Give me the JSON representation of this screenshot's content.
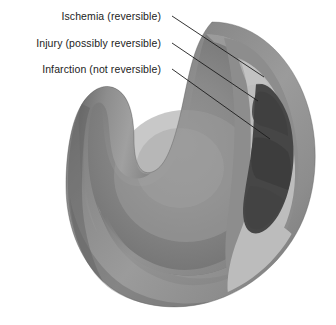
{
  "figure": {
    "type": "anatomical-cross-section",
    "background_color": "#ffffff",
    "callouts": [
      {
        "id": "ischemia",
        "label": "Ischemia (reversible)",
        "zone_name": "ischemia-zone",
        "zone_color": "#8f8f8f",
        "leader_from": [
          172,
          16
        ],
        "leader_to": [
          264,
          77
        ]
      },
      {
        "id": "injury",
        "label": "Injury (possibly reversible)",
        "zone_name": "injury-zone",
        "zone_color": "#bcbcbc",
        "leader_from": [
          172,
          43
        ],
        "leader_to": [
          258,
          101
        ]
      },
      {
        "id": "infarction",
        "label": "Infarction (not reversible)",
        "zone_name": "infarction-zone",
        "zone_color": "#454545",
        "leader_from": [
          172,
          69
        ],
        "leader_to": [
          270,
          139
        ]
      }
    ],
    "palette": {
      "outer_wall_light": "#9a9a9a",
      "outer_wall_mid": "#8a8a8a",
      "outer_wall_shadow": "#6f6f6f",
      "cavity_light": "#8b8b8b",
      "cavity_mid": "#7a7a7a",
      "cavity_dark": "#686868",
      "cut_face_light": "#a3a3a3",
      "cut_face_dark": "#767676",
      "ischemia": "#8f8f8f",
      "injury": "#bcbcbc",
      "infarction": "#454545",
      "leader_line": "#1c1c1c",
      "text": "#1c1c1c"
    }
  }
}
